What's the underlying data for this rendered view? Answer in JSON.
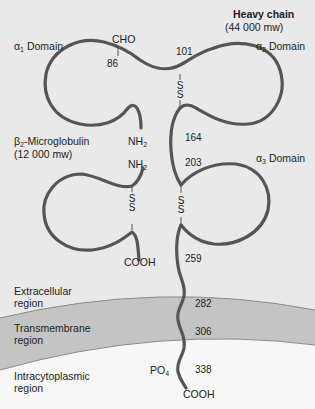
{
  "heavy_chain": {
    "title": "Heavy chain",
    "mw": "(44 000 mw)"
  },
  "domains": {
    "alpha1": {
      "greek": "α",
      "sub": "1",
      "label": " Domain"
    },
    "alpha2": {
      "greek": "α",
      "sub": "2",
      "label": " Domain"
    },
    "alpha3": {
      "greek": "α",
      "sub": "3",
      "label": " Domain"
    }
  },
  "beta2": {
    "greek": "β",
    "sub": "2",
    "label": "-Microglobulin",
    "mw": "(12 000 mw)"
  },
  "markers": {
    "cho": "CHO",
    "nh2_a": "NH",
    "nh2_b": "NH",
    "nh2_sub": "2",
    "cooh_beta": "COOH",
    "cooh_tail": "COOH",
    "po4": "PO",
    "po4_sub": "4",
    "s": "S"
  },
  "residues": [
    "86",
    "101",
    "164",
    "203",
    "259",
    "282",
    "306",
    "338"
  ],
  "regions": {
    "extracellular": [
      "Extracellular",
      "region"
    ],
    "transmembrane": [
      "Transmembrane",
      "region"
    ],
    "intracytoplasmic": [
      "Intracytoplasmic",
      "region"
    ]
  },
  "colors": {
    "background": "#e9e9e9",
    "membrane": "#c4c4c4",
    "cytoplasm": "#f7f7f7",
    "chain": "#555555",
    "membrane_edge": "#8a8a8a"
  }
}
